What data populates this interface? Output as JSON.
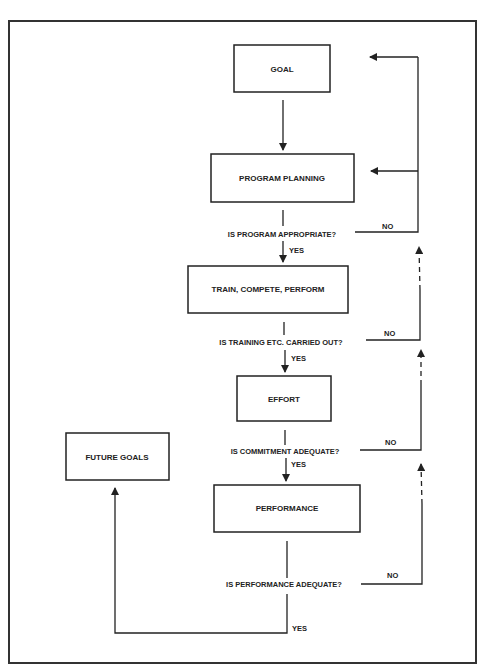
{
  "diagram": {
    "type": "flowchart",
    "boxes": {
      "goal": "GOAL",
      "program_planning": "PROGRAM PLANNING",
      "train": "TRAIN, COMPETE, PERFORM",
      "effort": "EFFORT",
      "performance": "PERFORMANCE",
      "future_goals": "FUTURE GOALS"
    },
    "questions": {
      "q1": "IS PROGRAM APPROPRIATE?",
      "q2": "IS TRAINING ETC. CARRIED OUT?",
      "q3": "IS COMMITMENT ADEQUATE?",
      "q4": "IS PERFORMANCE ADEQUATE?"
    },
    "answers": {
      "yes": "YES",
      "no": "NO"
    },
    "colors": {
      "line": "#222222",
      "background": "#ffffff"
    }
  }
}
